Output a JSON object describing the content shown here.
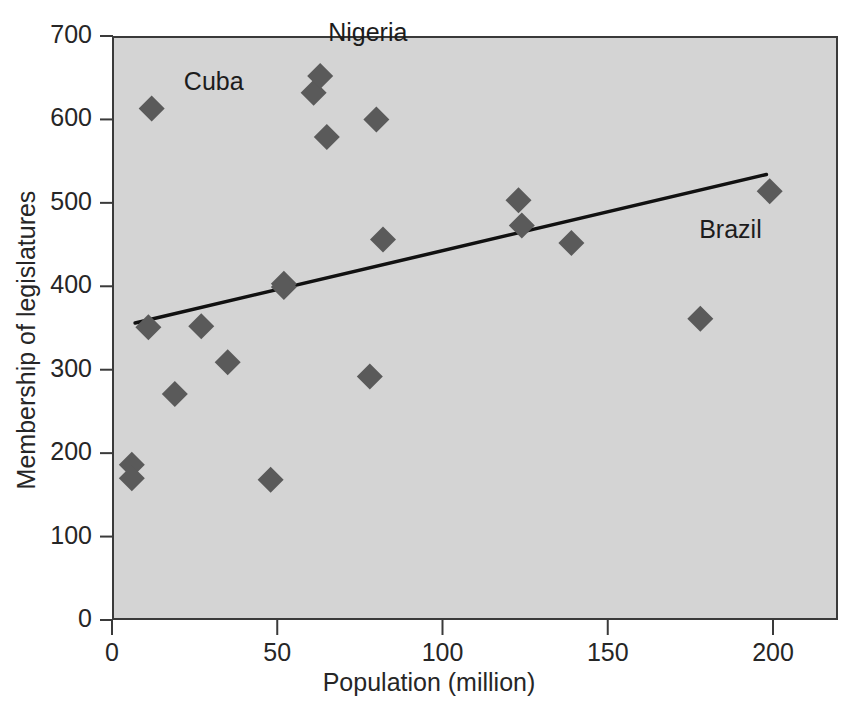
{
  "chart_data": {
    "type": "scatter",
    "title": "",
    "xlabel": "Population (million)",
    "ylabel": "Membership of legislatures",
    "xlim": [
      0,
      220
    ],
    "ylim": [
      0,
      700
    ],
    "xticks": [
      0,
      50,
      100,
      150,
      200
    ],
    "xtick_labels": [
      "0",
      "50",
      "100",
      "150",
      "200"
    ],
    "yticks": [
      0,
      100,
      200,
      300,
      400,
      500,
      600,
      700
    ],
    "ytick_labels": [
      "0",
      "100",
      "200",
      "300",
      "400",
      "500",
      "600",
      "700"
    ],
    "grid": false,
    "legend": null,
    "marker": "diamond",
    "marker_color": "#5a5a5a",
    "plot_background": "#d4d4d4",
    "axis_color": "#3a3a3a",
    "points": [
      {
        "x": 6,
        "y": 186,
        "label": ""
      },
      {
        "x": 6,
        "y": 170,
        "label": ""
      },
      {
        "x": 12,
        "y": 613,
        "label": ""
      },
      {
        "x": 11,
        "y": 351,
        "label": ""
      },
      {
        "x": 19,
        "y": 271,
        "label": ""
      },
      {
        "x": 27,
        "y": 352,
        "label": ""
      },
      {
        "x": 35,
        "y": 309,
        "label": ""
      },
      {
        "x": 48,
        "y": 168,
        "label": ""
      },
      {
        "x": 52,
        "y": 403,
        "label": ""
      },
      {
        "x": 52,
        "y": 399,
        "label": ""
      },
      {
        "x": 61,
        "y": 632,
        "label": "Cuba"
      },
      {
        "x": 63,
        "y": 652,
        "label": "Nigeria"
      },
      {
        "x": 65,
        "y": 579,
        "label": ""
      },
      {
        "x": 78,
        "y": 292,
        "label": ""
      },
      {
        "x": 80,
        "y": 600,
        "label": ""
      },
      {
        "x": 82,
        "y": 456,
        "label": ""
      },
      {
        "x": 123,
        "y": 503,
        "label": ""
      },
      {
        "x": 124,
        "y": 473,
        "label": ""
      },
      {
        "x": 139,
        "y": 452,
        "label": ""
      },
      {
        "x": 178,
        "y": 361,
        "label": ""
      },
      {
        "x": 199,
        "y": 514,
        "label": "Brazil"
      }
    ],
    "trendline": {
      "x0": 7,
      "y0": 356,
      "x1": 198,
      "y1": 534,
      "color": "#111111"
    },
    "annotations": [
      {
        "text": "Nigeria",
        "x": 63,
        "y": 652,
        "dx": 8,
        "dy": 42
      },
      {
        "text": "Cuba",
        "x": 61,
        "y": 632,
        "dx": -70,
        "dy": 10
      },
      {
        "text": "Brazil",
        "x": 199,
        "y": 514,
        "dx": -8,
        "dy": -40
      }
    ]
  },
  "axes": {
    "x_title": "Population (million)",
    "y_title": "Membership of legislatures"
  }
}
